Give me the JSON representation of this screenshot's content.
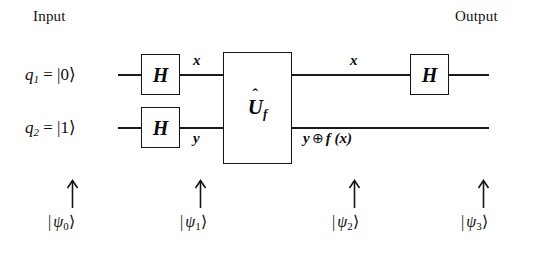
{
  "diagram": {
    "title_input": "Input",
    "title_output": "Output",
    "type": "quantum-circuit",
    "ink_color": "#141414",
    "background_color": "#ffffff"
  },
  "qubits": [
    {
      "id": "q1",
      "name": "q",
      "index": "1",
      "equals": "=",
      "state": "|0⟩"
    },
    {
      "id": "q2",
      "name": "q",
      "index": "2",
      "equals": "=",
      "state": "|1⟩"
    }
  ],
  "gates": [
    {
      "id": "h-q1-in",
      "label": "H",
      "wire": "q1",
      "stage": "input"
    },
    {
      "id": "h-q2-in",
      "label": "H",
      "wire": "q2",
      "stage": "input"
    },
    {
      "id": "oracle",
      "label": "U",
      "subscript": "f",
      "hat": "̂",
      "wires": [
        "q1",
        "q2"
      ],
      "stage": "oracle"
    },
    {
      "id": "h-q1-out",
      "label": "H",
      "wire": "q1",
      "stage": "output"
    }
  ],
  "wire_annotations": [
    {
      "id": "x-pre-oracle",
      "text": "x",
      "wire": "q1",
      "position": "before-oracle"
    },
    {
      "id": "y-pre-oracle",
      "text": "y",
      "wire": "q2",
      "position": "before-oracle"
    },
    {
      "id": "x-post-oracle",
      "text": "x",
      "wire": "q1",
      "position": "after-oracle"
    },
    {
      "id": "y-xor-fx",
      "text_lhs": "y",
      "operator": "⊕",
      "text_rhs": "f (x)",
      "wire": "q2",
      "position": "after-oracle"
    }
  ],
  "states": [
    {
      "id": "psi0",
      "bar": "|",
      "symbol": "ψ",
      "subscript": "0",
      "ket": "⟩",
      "arrow": "up-arrow"
    },
    {
      "id": "psi1",
      "bar": "|",
      "symbol": "ψ",
      "subscript": "1",
      "ket": "⟩",
      "arrow": "up-arrow"
    },
    {
      "id": "psi2",
      "bar": "|",
      "symbol": "ψ",
      "subscript": "2",
      "ket": "⟩",
      "arrow": "up-arrow"
    },
    {
      "id": "psi3",
      "bar": "|",
      "symbol": "ψ",
      "subscript": "3",
      "ket": "⟩",
      "arrow": "up-arrow"
    }
  ]
}
